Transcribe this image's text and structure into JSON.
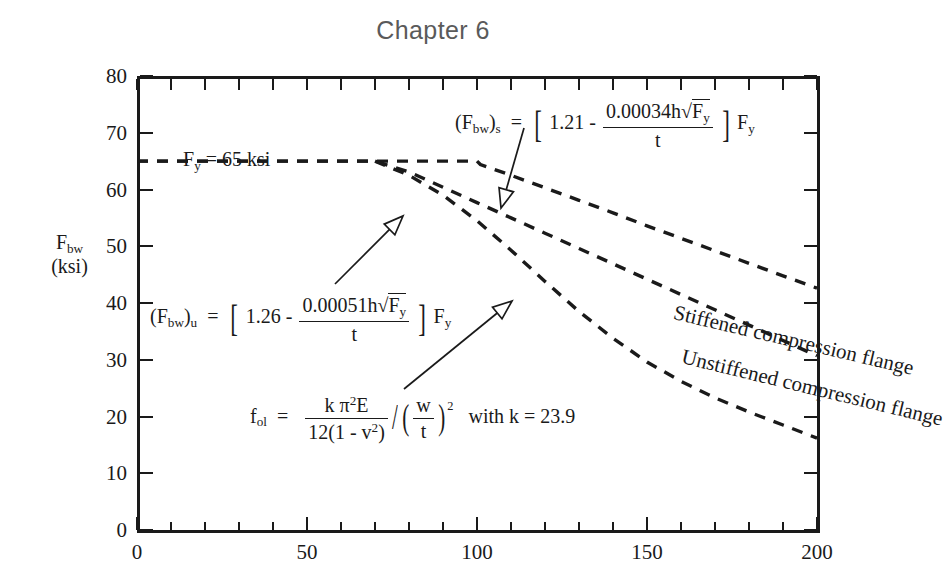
{
  "title": "Chapter 6",
  "axes": {
    "y_name_line1": "F",
    "y_name_sub": "bw",
    "y_name_line2": "(ksi)",
    "y_ticks": [
      "0",
      "10",
      "20",
      "30",
      "40",
      "50",
      "60",
      "70",
      "80"
    ],
    "x_ticks": [
      "0",
      "50",
      "100",
      "150",
      "200"
    ],
    "ylim": [
      0,
      80
    ],
    "xlim": [
      0,
      200
    ]
  },
  "annotations": {
    "fy_label": "F",
    "fy_label_sub": "y",
    "fy_label_rest": " = 65 ksi",
    "curve_label_stiffened": "Stiffened compression flange",
    "curve_label_unstiffened": "Unstiffened compression flange",
    "with_k": "with k = 23.9"
  },
  "formulas": {
    "stiffened": {
      "lhs": "(F",
      "lhs_sub1": "bw",
      "lhs_sub2": "s",
      "eq": "=",
      "const": "1.21",
      "minus": "-",
      "num": "0.00034h",
      "radicand": "F",
      "radicand_sub": "y",
      "den": "t",
      "trail": "F",
      "trail_sub": "y"
    },
    "unstiffened": {
      "lhs": "(F",
      "lhs_sub1": "bw",
      "lhs_sub2": "u",
      "eq": "=",
      "const": "1.26",
      "minus": "-",
      "num": "0.00051h",
      "radicand": "F",
      "radicand_sub": "y",
      "den": "t",
      "trail": "F",
      "trail_sub": "y"
    },
    "elastic": {
      "lhs": "f",
      "lhs_sub": "ol",
      "eq": "=",
      "num": "k π",
      "num_sup": "2",
      "num_e": "E",
      "den": "12(1 - v",
      "den_sup": "2",
      "den_close": ")",
      "div": "/",
      "ratio_num": "w",
      "ratio_den": "t",
      "ratio_sup": "2"
    }
  },
  "chart_data": {
    "type": "line",
    "title": "Chapter 6",
    "xlabel": "",
    "ylabel": "F_bw (ksi)",
    "xlim": [
      0,
      200
    ],
    "ylim": [
      0,
      80
    ],
    "grid": false,
    "legend": "inline-curve-labels",
    "xticks": [
      0,
      50,
      100,
      150,
      200
    ],
    "yticks": [
      0,
      10,
      20,
      30,
      40,
      50,
      60,
      70,
      80
    ],
    "minor_tick_step_x": 10,
    "minor_tick_step_y": 10,
    "linestyle": "dashed",
    "series": [
      {
        "name": "Stiffened compression flange",
        "formula": "(F_bw)_s = [1.21 - 0.00034*h*sqrt(F_y)/t] * F_y",
        "x": [
          0,
          10,
          20,
          30,
          40,
          50,
          60,
          70,
          80,
          90,
          100,
          101,
          110,
          120,
          130,
          140,
          150,
          160,
          170,
          180,
          190,
          200
        ],
        "y": [
          65,
          65,
          65,
          65,
          65,
          65,
          65,
          65,
          65,
          65,
          65,
          64.4,
          62.5,
          60.3,
          58.1,
          55.9,
          53.6,
          51.4,
          49.2,
          47.0,
          44.8,
          42.6
        ]
      },
      {
        "name": "Unstiffened compression flange",
        "formula": "(F_bw)_u = [1.26 - 0.00051*h*sqrt(F_y)/t] * F_y",
        "x": [
          0,
          10,
          20,
          30,
          40,
          50,
          60,
          70,
          80,
          90,
          100,
          110,
          120,
          130,
          140,
          150,
          160,
          170,
          180,
          190,
          200
        ],
        "y": [
          65,
          65,
          65,
          65,
          65,
          65,
          65,
          65,
          63.1,
          60.4,
          57.7,
          55.0,
          52.3,
          49.6,
          46.9,
          44.2,
          41.5,
          38.8,
          36.1,
          33.4,
          30.7
        ]
      },
      {
        "name": "f_ol elastic buckling",
        "formula": "f_ol = k*pi^2*E / (12(1 - v^2)) / (w/t)^2  with k = 23.9",
        "x": [
          70,
          80,
          90,
          100,
          110,
          120,
          130,
          140,
          150,
          160,
          170,
          180,
          190,
          200
        ],
        "y": [
          65,
          62.5,
          59.0,
          54.5,
          49.3,
          43.8,
          38.5,
          33.8,
          29.6,
          26.2,
          23.3,
          20.8,
          18.5,
          16.2
        ]
      }
    ],
    "annotations": [
      {
        "text": "F_y = 65 ksi",
        "x": 12,
        "y": 70
      },
      {
        "text": "(F_bw)_s = [1.21 - 0.00034h√F_y/t] F_y",
        "x": 95,
        "y": 78,
        "arrow_to": [
          112,
          59
        ]
      },
      {
        "text": "(F_bw)_u = [1.26 - 0.00051h√F_y/t] F_y",
        "x": 8,
        "y": 44,
        "arrow_to": [
          82,
          61
        ]
      },
      {
        "text": "f_ol = kπ²E/12(1-v²) / (w/t)²  with k = 23.9",
        "x": 35,
        "y": 23,
        "arrow_to": [
          118,
          48
        ]
      }
    ]
  }
}
